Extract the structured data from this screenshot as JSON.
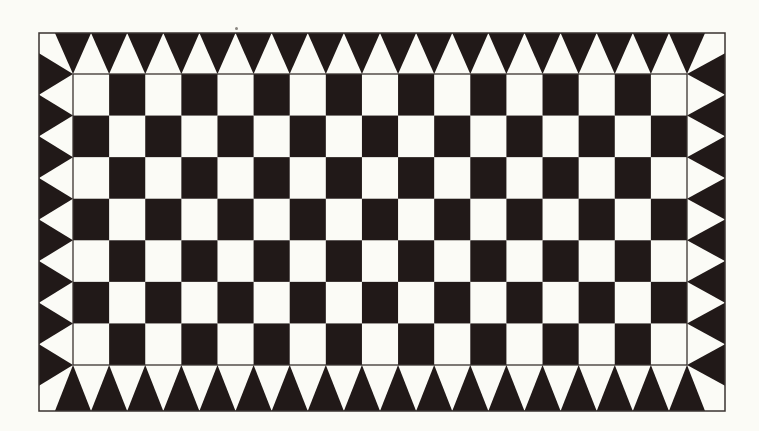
{
  "pattern": {
    "name": "checkerboard-with-sawtooth-border",
    "colors": {
      "background": "#fbfbf6",
      "ink": "#211918",
      "stroke": "#3a3330"
    },
    "outer_border": {
      "x": 39,
      "y": 33,
      "width": 686,
      "height": 378
    },
    "grid": {
      "x": 73,
      "y": 74,
      "width": 614,
      "height": 291,
      "columns": 17,
      "rows": 7,
      "first_cell_color": "light"
    },
    "border_triangles": {
      "top": {
        "count": 18,
        "direction": "down"
      },
      "bottom": {
        "count": 18,
        "direction": "up"
      },
      "left": {
        "count": 8,
        "direction": "right"
      },
      "right": {
        "count": 8,
        "direction": "left"
      }
    },
    "artifacts": [
      {
        "x": 235,
        "y": 27
      }
    ]
  }
}
